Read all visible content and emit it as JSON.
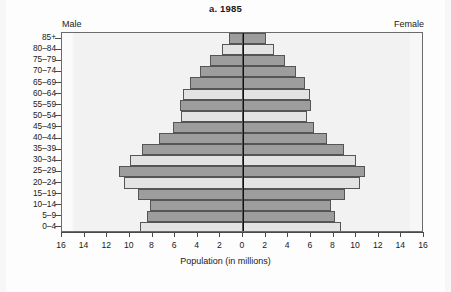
{
  "chart_data": {
    "type": "bar",
    "subtype": "population-pyramid",
    "title": "a. 1985",
    "xlabel": "Population (in millions)",
    "ylabel": "",
    "left_group_label": "Male",
    "right_group_label": "Female",
    "categories": [
      "0–4",
      "5–9",
      "10–14",
      "15–19",
      "20–24",
      "25–29",
      "30–34",
      "35–39",
      "40–44",
      "45–49",
      "50–54",
      "55–59",
      "60–64",
      "65–69",
      "70–74",
      "75–79",
      "80–84",
      "85+"
    ],
    "xlim": [
      -16,
      16
    ],
    "xticks": [
      -16,
      -14,
      -12,
      -10,
      -8,
      -6,
      -4,
      -2,
      0,
      2,
      4,
      6,
      8,
      10,
      12,
      14,
      16
    ],
    "xtick_labels": [
      "16",
      "14",
      "12",
      "10",
      "8",
      "6",
      "4",
      "2",
      "0",
      "2",
      "4",
      "6",
      "8",
      "10",
      "12",
      "14",
      "16"
    ],
    "grid": false,
    "legend": "none",
    "series": [
      {
        "name": "Male",
        "side": "left",
        "values": [
          9.1,
          8.5,
          8.2,
          9.3,
          10.5,
          11.0,
          10.0,
          8.9,
          7.4,
          6.2,
          5.5,
          5.6,
          5.3,
          4.7,
          3.8,
          2.9,
          1.9,
          1.2
        ]
      },
      {
        "name": "Female",
        "side": "right",
        "values": [
          8.7,
          8.1,
          7.8,
          9.0,
          10.3,
          10.8,
          10.0,
          8.9,
          7.4,
          6.3,
          5.7,
          6.0,
          5.9,
          5.5,
          4.7,
          3.7,
          2.7,
          2.0
        ]
      }
    ],
    "row_shades": [
      "light",
      "dark",
      "dark",
      "dark",
      "light",
      "dark",
      "light",
      "dark",
      "dark",
      "dark",
      "light",
      "dark",
      "light",
      "dark",
      "dark",
      "dark",
      "light",
      "dark"
    ],
    "colors": {
      "bar_light": "#e3e3e3",
      "bar_dark": "#9d9d9d",
      "bar_border": "#555555",
      "plot_background": "#f2f2f2",
      "axis": "#4a4a4a",
      "center_line": "#111111",
      "text": "#1a1a1a"
    }
  }
}
